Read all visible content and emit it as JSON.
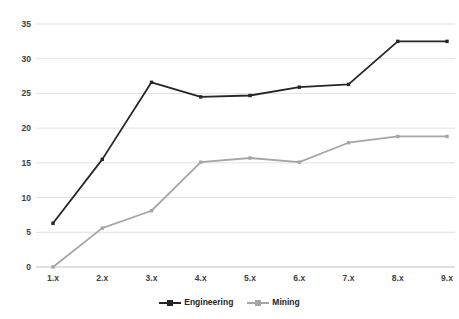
{
  "chart_data": {
    "type": "line",
    "title": "",
    "subtitle": "",
    "xlabel": "",
    "ylabel": "",
    "categories": [
      "1.x",
      "2.x",
      "3.x",
      "4.x",
      "5.x",
      "6.x",
      "7.x",
      "8.x",
      "9.x"
    ],
    "series": [
      {
        "name": "Engineering",
        "color": "#262626",
        "marker": "square",
        "values": [
          6.3,
          15.5,
          26.6,
          24.5,
          24.7,
          25.9,
          26.3,
          32.5,
          32.5
        ]
      },
      {
        "name": "Mining",
        "color": "#a6a6a6",
        "marker": "square",
        "values": [
          0.0,
          5.6,
          8.1,
          15.1,
          15.7,
          15.1,
          17.9,
          18.8,
          18.8
        ]
      }
    ],
    "ylim": [
      0,
      35
    ],
    "ytick_labels": [
      "0",
      "5",
      "10",
      "15",
      "20",
      "25",
      "30",
      "35"
    ],
    "ytick_values": [
      0,
      5,
      10,
      15,
      20,
      25,
      30,
      35
    ],
    "grid": true,
    "grid_color": "#d9d9d9",
    "axis_color": "#bfbfbf",
    "legend_position": "bottom",
    "background": "#ffffff"
  },
  "legend": {
    "items": [
      {
        "label": "Engineering",
        "color": "#262626"
      },
      {
        "label": "Mining",
        "color": "#a6a6a6"
      }
    ]
  }
}
